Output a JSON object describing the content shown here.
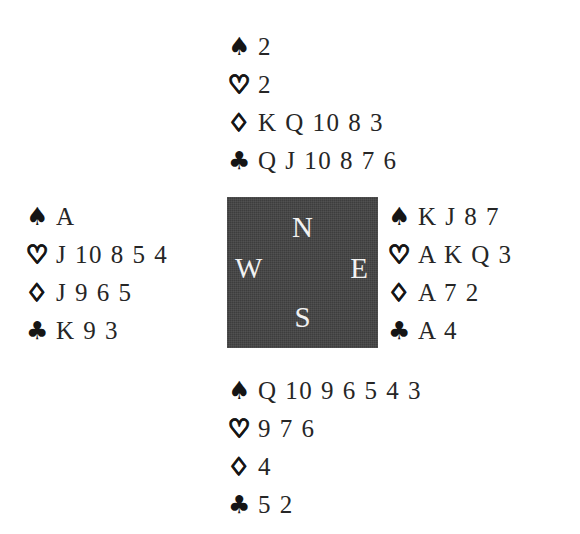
{
  "diagram": {
    "background_color": "#ffffff",
    "text_color": "#262626"
  },
  "compass": {
    "box_color": "#3d3d3d",
    "label_color": "#f2f2f2",
    "north": "N",
    "west": "W",
    "east": "E",
    "south": "S"
  },
  "suits": {
    "spade": "♠",
    "heart": "♡",
    "diamond": "♢",
    "club": "♣"
  },
  "hands": {
    "north": {
      "position_label": "N",
      "spades": "2",
      "hearts": "2",
      "diamonds": "K Q 10 8 3",
      "clubs": "Q J 10 8 7 6"
    },
    "west": {
      "position_label": "W",
      "spades": "A",
      "hearts": "J 10 8 5 4",
      "diamonds": "J 9 6 5",
      "clubs": "K 9 3"
    },
    "east": {
      "position_label": "E",
      "spades": "K J 8 7",
      "hearts": "A K Q 3",
      "diamonds": "A 7 2",
      "clubs": "A 4"
    },
    "south": {
      "position_label": "S",
      "spades": "Q 10 9 6 5 4 3",
      "hearts": "9 7 6",
      "diamonds": "4",
      "clubs": "5 2"
    }
  }
}
